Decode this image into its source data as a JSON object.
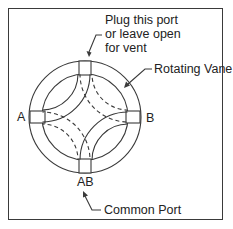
{
  "diagram": {
    "labels": {
      "plug_port": "Plug this port\nor leave open\nfor vent",
      "rotating_vane": "Rotating Vane",
      "port_a": "A",
      "port_b": "B",
      "port_ab": "AB",
      "common_port": "Common Port"
    },
    "colors": {
      "line": "#3a3a3a",
      "background": "#ffffff"
    },
    "geometry": {
      "center": [
        85,
        117
      ],
      "outer_radius": 56,
      "inner_radius": 43
    }
  }
}
